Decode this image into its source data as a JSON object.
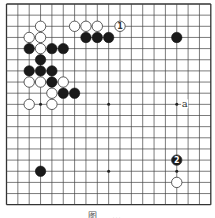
{
  "board": {
    "size": 19,
    "origin_x": 6.5,
    "origin_y": 4,
    "spacing_x": 11.35,
    "spacing_y": 11.15,
    "stone_radius": 5.2,
    "line_color": "#444444",
    "edge_color": "#333333",
    "hoshi": [
      [
        3,
        3
      ],
      [
        9,
        3
      ],
      [
        15,
        3
      ],
      [
        3,
        9
      ],
      [
        9,
        9
      ],
      [
        15,
        9
      ],
      [
        3,
        15
      ],
      [
        9,
        15
      ],
      [
        15,
        15
      ]
    ]
  },
  "stones": {
    "black": [
      [
        7,
        3
      ],
      [
        8,
        3
      ],
      [
        9,
        3
      ],
      [
        15,
        3
      ],
      [
        2,
        4
      ],
      [
        4,
        4
      ],
      [
        5,
        4
      ],
      [
        3,
        5
      ],
      [
        2,
        6
      ],
      [
        3,
        6
      ],
      [
        4,
        6
      ],
      [
        4,
        7
      ],
      [
        5,
        8
      ],
      [
        6,
        8
      ],
      [
        3,
        15
      ]
    ],
    "white": [
      [
        3,
        2
      ],
      [
        6,
        2
      ],
      [
        7,
        2
      ],
      [
        8,
        2
      ],
      [
        2,
        3
      ],
      [
        3,
        3
      ],
      [
        3,
        4
      ],
      [
        2,
        7
      ],
      [
        3,
        7
      ],
      [
        5,
        7
      ],
      [
        4,
        8
      ],
      [
        2,
        9
      ],
      [
        4,
        9
      ],
      [
        15,
        16
      ]
    ]
  },
  "numbered_stones": [
    {
      "color": "white",
      "col": 10,
      "row": 2,
      "label": "1"
    },
    {
      "color": "black",
      "col": 15,
      "row": 14,
      "label": "2"
    }
  ],
  "labels": [
    {
      "text": "a",
      "col": 15.7,
      "row": 9
    }
  ],
  "caption": "图 …"
}
